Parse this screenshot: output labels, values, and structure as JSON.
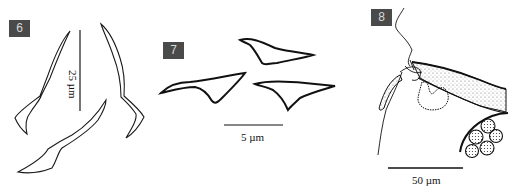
{
  "figure": {
    "panels": [
      {
        "id": "6",
        "label": "6",
        "scale_bar": "25 µm",
        "description": "three sclerotized spines/hooks, curved outline drawings"
      },
      {
        "id": "7",
        "label": "7",
        "scale_bar": "5 µm",
        "description": "three small triangular anchor-like sclerites"
      },
      {
        "id": "8",
        "label": "8",
        "scale_bar": "50 µm",
        "description": "copulatory organ with stippled duct and cluster of spherical cells"
      }
    ],
    "label_color": "#4a4a4a",
    "line_color": "#1a1a1a"
  }
}
